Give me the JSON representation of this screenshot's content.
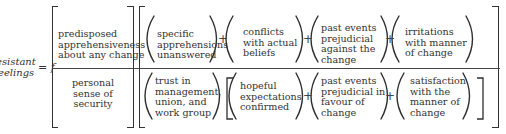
{
  "equation": {
    "lhs": {
      "line1": "esistant",
      "line2": "eelings"
    },
    "equals_f": "= f",
    "bracket_one": {
      "top": {
        "line1": "predisposed",
        "line2": "apprehensiveness",
        "line3": "about any change"
      },
      "bottom": {
        "line1": "personal",
        "line2": "sense of",
        "line3": "security"
      }
    },
    "top_row": {
      "terms": [
        {
          "line1": "specific",
          "line2": "apprehensions",
          "line3": "unanswered",
          "line4": ""
        },
        {
          "line1": "conflicts",
          "line2": "with actual",
          "line3": "beliefs",
          "line4": ""
        },
        {
          "line1": "past events",
          "line2": "prejudicial",
          "line3": "against the",
          "line4": "change"
        },
        {
          "line1": "irritations",
          "line2": "with manner",
          "line3": "of change",
          "line4": ""
        }
      ],
      "operator": "+"
    },
    "bottom_row": {
      "lead_term": {
        "line1": "trust in",
        "line2": "management,",
        "line3": "union, and",
        "line4": "work group"
      },
      "bracket_terms": [
        {
          "line1": "hopeful",
          "line2": "expectations",
          "line3": "confirmed",
          "line4": ""
        },
        {
          "line1": "past events",
          "line2": "prejudicial in",
          "line3": "favour of",
          "line4": "change"
        },
        {
          "line1": "satisfaction",
          "line2": "with the",
          "line3": "manner of",
          "line4": "change"
        }
      ],
      "operator": "+"
    }
  }
}
